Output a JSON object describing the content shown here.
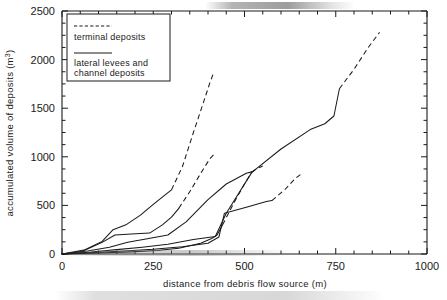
{
  "chart_data": {
    "type": "line",
    "title": "",
    "xlabel": "distance from debris flow source (m)",
    "ylabel": "accumulated volume of deposits (m³)",
    "xlim": [
      0,
      1000
    ],
    "ylim": [
      0,
      2500
    ],
    "xticks": [
      0,
      250,
      500,
      750,
      1000
    ],
    "yticks": [
      0,
      500,
      1000,
      1500,
      2000,
      2500
    ],
    "x_minor_tick_step": 50,
    "y_minor_tick_step": 125,
    "grid": false,
    "legend_position": "top-left-inside",
    "legend": [
      {
        "label": "terminal deposits",
        "style": "dashed"
      },
      {
        "label": "lateral levees and channel deposits",
        "style": "solid"
      }
    ],
    "series": [
      {
        "name": "debris flow 1",
        "solid_points": [
          [
            0,
            0
          ],
          [
            60,
            40
          ],
          [
            110,
            130
          ],
          [
            140,
            250
          ],
          [
            175,
            300
          ],
          [
            215,
            400
          ],
          [
            250,
            510
          ],
          [
            280,
            600
          ],
          [
            300,
            660
          ]
        ],
        "dashed_points": [
          [
            300,
            660
          ],
          [
            330,
            900
          ],
          [
            360,
            1250
          ],
          [
            385,
            1530
          ],
          [
            405,
            1760
          ],
          [
            415,
            1860
          ]
        ]
      },
      {
        "name": "debris flow 2",
        "solid_points": [
          [
            0,
            0
          ],
          [
            55,
            25
          ],
          [
            110,
            120
          ],
          [
            145,
            195
          ],
          [
            190,
            205
          ],
          [
            240,
            215
          ],
          [
            275,
            300
          ],
          [
            300,
            380
          ],
          [
            320,
            470
          ]
        ],
        "dashed_points": [
          [
            320,
            470
          ],
          [
            350,
            640
          ],
          [
            380,
            830
          ],
          [
            405,
            980
          ],
          [
            420,
            1040
          ]
        ]
      },
      {
        "name": "debris flow 3",
        "solid_points": [
          [
            0,
            0
          ],
          [
            70,
            30
          ],
          [
            130,
            70
          ],
          [
            180,
            120
          ],
          [
            230,
            155
          ],
          [
            290,
            195
          ],
          [
            340,
            330
          ],
          [
            400,
            560
          ],
          [
            450,
            720
          ],
          [
            505,
            830
          ],
          [
            520,
            845
          ]
        ],
        "dashed_points": [
          [
            520,
            845
          ],
          [
            535,
            880
          ],
          [
            550,
            905
          ]
        ]
      },
      {
        "name": "debris flow 4",
        "solid_points": [
          [
            0,
            0
          ],
          [
            80,
            20
          ],
          [
            150,
            45
          ],
          [
            220,
            70
          ],
          [
            290,
            100
          ],
          [
            360,
            150
          ],
          [
            420,
            180
          ],
          [
            450,
            420
          ],
          [
            520,
            840
          ],
          [
            600,
            1080
          ],
          [
            680,
            1280
          ],
          [
            720,
            1340
          ],
          [
            745,
            1420
          ],
          [
            760,
            1700
          ]
        ],
        "dashed_points": [
          [
            760,
            1700
          ],
          [
            800,
            1900
          ],
          [
            840,
            2130
          ],
          [
            870,
            2280
          ]
        ]
      },
      {
        "name": "debris flow 5",
        "solid_points": [
          [
            0,
            0
          ],
          [
            90,
            15
          ],
          [
            170,
            30
          ],
          [
            250,
            48
          ],
          [
            330,
            75
          ],
          [
            400,
            110
          ],
          [
            430,
            175
          ],
          [
            445,
            420
          ],
          [
            505,
            480
          ],
          [
            560,
            540
          ],
          [
            575,
            550
          ]
        ],
        "dashed_points": [
          [
            575,
            550
          ],
          [
            610,
            660
          ],
          [
            640,
            780
          ],
          [
            660,
            835
          ]
        ]
      },
      {
        "name": "debris flow 6",
        "solid_points": [
          [
            0,
            0
          ],
          [
            100,
            10
          ],
          [
            190,
            22
          ],
          [
            260,
            35
          ],
          [
            320,
            60
          ],
          [
            380,
            110
          ],
          [
            410,
            160
          ],
          [
            425,
            195
          ],
          [
            440,
            300
          ]
        ],
        "dashed_points": [
          [
            440,
            300
          ],
          [
            470,
            520
          ],
          [
            500,
            720
          ],
          [
            520,
            840
          ],
          [
            535,
            885
          ]
        ]
      }
    ]
  },
  "axes": {
    "x_tick_labels": [
      "0",
      "250",
      "500",
      "750",
      "1000"
    ],
    "y_tick_labels": [
      "0",
      "500",
      "1000",
      "1500",
      "2000",
      "2500"
    ],
    "x_axis_title": "distance from debris flow source (m)",
    "y_axis_title_main": "accumulated volume of deposits (m",
    "y_axis_title_sup": "3",
    "y_axis_title_tail": ")"
  },
  "legend": {
    "entry_1_label": "terminal deposits",
    "entry_2_label_line1": "lateral levees and",
    "entry_2_label_line2": "channel deposits"
  },
  "colors": {
    "ink": "#1a1a1a",
    "paper": "#ffffff"
  }
}
